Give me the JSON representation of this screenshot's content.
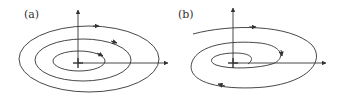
{
  "panels": [
    {
      "label": "(a)",
      "description": "Closed concentric orbits (center) around equilibrium"
    },
    {
      "label": "(b)",
      "description": "Orbit spiraling into equilibrium (stable focus)"
    }
  ],
  "colors": {
    "stroke": "#333333"
  }
}
